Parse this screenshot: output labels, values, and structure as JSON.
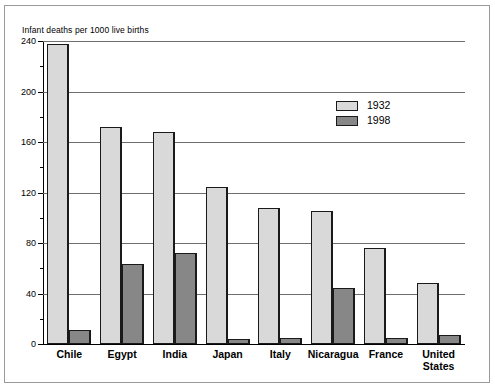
{
  "chart_data": {
    "type": "bar",
    "title": "Infant deaths per 1000 live births",
    "xlabel": "",
    "ylabel": "Infant deaths per 1000 live births",
    "ylim": [
      0,
      240
    ],
    "ytick_step": 40,
    "yticks": [
      0,
      40,
      80,
      120,
      160,
      200,
      240
    ],
    "ytick_labels": [
      "0",
      "40",
      "80",
      "120",
      "160",
      "200",
      "240"
    ],
    "minor_tick_step": 20,
    "grid": true,
    "grid_axis": "y",
    "legend_position": "upper right",
    "categories": [
      "Chile",
      "Egypt",
      "India",
      "Japan",
      "Italy",
      "Nicaragua",
      "France",
      "United States"
    ],
    "series": [
      {
        "name": "1932",
        "color": "#d9d9d9",
        "values": [
          238,
          172,
          168,
          124,
          108,
          105,
          76,
          48
        ]
      },
      {
        "name": "1998",
        "color": "#878787",
        "values": [
          11,
          63,
          72,
          4,
          5,
          44,
          5,
          7
        ]
      }
    ]
  },
  "legend": {
    "items": [
      {
        "label": "1932",
        "color": "#d9d9d9"
      },
      {
        "label": "1998",
        "color": "#878787"
      }
    ]
  }
}
